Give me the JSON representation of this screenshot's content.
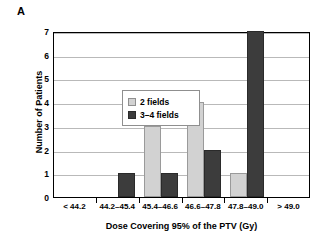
{
  "panel": {
    "label": "A"
  },
  "chart_data": {
    "type": "bar",
    "title": "",
    "panel_label": "A",
    "xlabel": "Dose Covering 95% of the PTV (Gy)",
    "ylabel": "Number of Patients",
    "categories": [
      "< 44.2",
      "44.2–45.4",
      "45.4–46.6",
      "46.6–47.8",
      "47.8–49.0",
      "> 49.0"
    ],
    "series": [
      {
        "name": "2 fields",
        "color": "#d2d2d2",
        "values": [
          0,
          0,
          3,
          4,
          1,
          0
        ]
      },
      {
        "name": "3–4 fields",
        "color": "#3c3c3c",
        "values": [
          0,
          1,
          1,
          2,
          7,
          0
        ]
      }
    ],
    "ylim": [
      0,
      7
    ],
    "yticks": [
      0,
      1,
      2,
      3,
      4,
      5,
      6,
      7
    ],
    "ytick_labels": [
      "0",
      "1",
      "2",
      "3",
      "4",
      "5",
      "6",
      "7"
    ],
    "grid": "horizontal",
    "legend_position": "upper-left-inside"
  }
}
